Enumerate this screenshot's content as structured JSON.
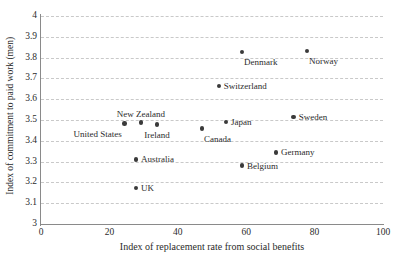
{
  "chart_data": {
    "type": "scatter",
    "title": "",
    "xlabel": "Index of replacement rate from social benefits",
    "ylabel": "Index of commitment to paid work (men)",
    "xlim": [
      0,
      100
    ],
    "ylim": [
      3,
      4
    ],
    "xticks": [
      0,
      20,
      40,
      60,
      80,
      100
    ],
    "yticks": [
      "3",
      "3.1",
      "3.2",
      "3.3",
      "3.4",
      "3.5",
      "3.6",
      "3.7",
      "3.8",
      "3.9",
      "4"
    ],
    "grid": "horizontal-dashed",
    "legend": "none",
    "marker_color": "#3a3a3a",
    "grid_color": "#c9c9c9",
    "axis_color": "#8a8a8a",
    "points": [
      {
        "name": "United States",
        "x": 24.5,
        "y": 3.483,
        "label_pos": "left-below"
      },
      {
        "name": "New Zealand",
        "x": 29.2,
        "y": 3.487,
        "label_pos": "above"
      },
      {
        "name": "Ireland",
        "x": 33.9,
        "y": 3.478,
        "label_pos": "below"
      },
      {
        "name": "Australia",
        "x": 27.8,
        "y": 3.311,
        "label_pos": "right"
      },
      {
        "name": "UK",
        "x": 27.8,
        "y": 3.173,
        "label_pos": "right"
      },
      {
        "name": "Canada",
        "x": 47.1,
        "y": 3.458,
        "label_pos": "right-below"
      },
      {
        "name": "Japan",
        "x": 54.1,
        "y": 3.49,
        "label_pos": "right"
      },
      {
        "name": "Switzerland",
        "x": 52.0,
        "y": 3.663,
        "label_pos": "right"
      },
      {
        "name": "Denmark",
        "x": 58.8,
        "y": 3.827,
        "label_pos": "right-below"
      },
      {
        "name": "Norway",
        "x": 77.8,
        "y": 3.832,
        "label_pos": "right-below"
      },
      {
        "name": "Sweden",
        "x": 73.9,
        "y": 3.514,
        "label_pos": "right"
      },
      {
        "name": "Germany",
        "x": 68.7,
        "y": 3.344,
        "label_pos": "right"
      },
      {
        "name": "Belgium",
        "x": 58.8,
        "y": 3.28,
        "label_pos": "right"
      }
    ]
  }
}
